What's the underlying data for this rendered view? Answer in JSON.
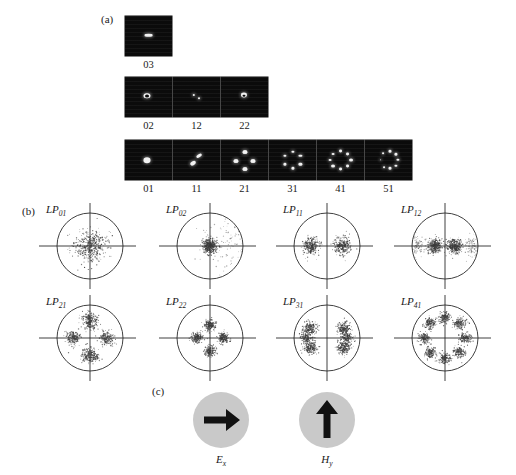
{
  "figure": {
    "background": "#ffffff",
    "ink": "#1a1a1a"
  },
  "panels": {
    "a": {
      "tag": "(a)"
    },
    "b": {
      "tag": "(b)"
    },
    "c": {
      "tag": "(c)"
    }
  },
  "chart_data": {
    "type": "scatter",
    "title": "",
    "xlabel": "",
    "ylabel": "",
    "grid": false,
    "legend": null,
    "near_field_rows": [
      {
        "row": 1,
        "cells": [
          {
            "label": "03",
            "lobes": 1,
            "arrangement": "single-horizontal-bar",
            "points": [
              {
                "x": 50,
                "y": 48,
                "rx": 9.5,
                "ry": 3.0
              }
            ]
          }
        ]
      },
      {
        "row": 2,
        "cells": [
          {
            "label": "02",
            "lobes": 1,
            "arrangement": "ring-bright-core",
            "points": [
              {
                "x": 46,
                "y": 47,
                "rx": 7.5,
                "ry": 7.0
              },
              {
                "x": 46,
                "y": 47,
                "rx": 4.2,
                "ry": 4.0,
                "dark": true
              }
            ]
          },
          {
            "label": "12",
            "lobes": 2,
            "arrangement": "two-faint-lobes",
            "points": [
              {
                "x": 44,
                "y": 44,
                "rx": 2.6,
                "ry": 2.4
              },
              {
                "x": 56,
                "y": 53,
                "rx": 2.2,
                "ry": 2.0
              }
            ]
          },
          {
            "label": "22",
            "lobes": 1,
            "arrangement": "ring-bright-core",
            "points": [
              {
                "x": 48,
                "y": 46,
                "rx": 6.5,
                "ry": 6.2
              },
              {
                "x": 49,
                "y": 47,
                "rx": 3.2,
                "ry": 3.0,
                "dark": true
              }
            ]
          }
        ]
      },
      {
        "row": 3,
        "cells": [
          {
            "label": "01",
            "lobes": 1,
            "arrangement": "single-round-blob",
            "points": [
              {
                "x": 47,
                "y": 50,
                "rx": 7.5,
                "ry": 7.0
              }
            ]
          },
          {
            "label": "11",
            "lobes": 2,
            "arrangement": "two-lobes-diagonal",
            "points": [
              {
                "x": 55,
                "y": 40,
                "rx": 6.0,
                "ry": 4.2,
                "rot": -30
              },
              {
                "x": 42,
                "y": 57,
                "rx": 6.5,
                "ry": 4.6,
                "rot": -30
              }
            ]
          },
          {
            "label": "21",
            "lobes": 4,
            "arrangement": "four-lobe-ring",
            "points": [
              {
                "x": 50,
                "y": 30,
                "rx": 5.4,
                "ry": 4.8
              },
              {
                "x": 69,
                "y": 52,
                "rx": 5.4,
                "ry": 4.8
              },
              {
                "x": 50,
                "y": 72,
                "rx": 5.4,
                "ry": 4.8
              },
              {
                "x": 31,
                "y": 52,
                "rx": 5.4,
                "ry": 4.8
              }
            ]
          },
          {
            "label": "31",
            "lobes": 6,
            "arrangement": "six-lobe-ring",
            "points": [
              {
                "x": 50,
                "y": 30,
                "rx": 3.4,
                "ry": 3.0
              },
              {
                "x": 67,
                "y": 40,
                "rx": 3.4,
                "ry": 3.0
              },
              {
                "x": 67,
                "y": 61,
                "rx": 3.4,
                "ry": 3.0
              },
              {
                "x": 50,
                "y": 71,
                "rx": 3.4,
                "ry": 3.0
              },
              {
                "x": 33,
                "y": 61,
                "rx": 3.4,
                "ry": 3.0
              },
              {
                "x": 33,
                "y": 40,
                "rx": 3.4,
                "ry": 3.0
              }
            ]
          },
          {
            "label": "41",
            "lobes": 8,
            "arrangement": "eight-lobe-ring",
            "points": [
              {
                "x": 50,
                "y": 28,
                "rx": 4.2,
                "ry": 3.8
              },
              {
                "x": 65,
                "y": 34,
                "rx": 4.2,
                "ry": 3.8
              },
              {
                "x": 72,
                "y": 50,
                "rx": 4.2,
                "ry": 3.8
              },
              {
                "x": 65,
                "y": 66,
                "rx": 4.2,
                "ry": 3.8
              },
              {
                "x": 50,
                "y": 72,
                "rx": 4.2,
                "ry": 3.8
              },
              {
                "x": 35,
                "y": 66,
                "rx": 4.2,
                "ry": 3.8
              },
              {
                "x": 28,
                "y": 50,
                "rx": 3.0,
                "ry": 2.8
              },
              {
                "x": 35,
                "y": 34,
                "rx": 3.0,
                "ry": 2.8
              }
            ]
          },
          {
            "label": "51",
            "lobes": 8,
            "arrangement": "eight-lobe-ring-partial",
            "points": [
              {
                "x": 54,
                "y": 28,
                "rx": 3.2,
                "ry": 2.9
              },
              {
                "x": 66,
                "y": 36,
                "rx": 3.4,
                "ry": 3.0
              },
              {
                "x": 70,
                "y": 50,
                "rx": 3.4,
                "ry": 3.0
              },
              {
                "x": 66,
                "y": 64,
                "rx": 3.4,
                "ry": 3.0
              },
              {
                "x": 54,
                "y": 71,
                "rx": 3.2,
                "ry": 2.9
              },
              {
                "x": 40,
                "y": 68,
                "rx": 2.0,
                "ry": 1.8
              },
              {
                "x": 33,
                "y": 50,
                "rx": 2.0,
                "ry": 1.8
              },
              {
                "x": 38,
                "y": 33,
                "rx": 2.0,
                "ry": 1.8
              }
            ]
          }
        ]
      }
    ],
    "far_field_plots": [
      {
        "label": "LP",
        "sub": "01",
        "lobe_count": 1,
        "lobes": [
          {
            "r": 0.0,
            "theta": 0,
            "spread": 0.46,
            "n": 420,
            "weight": 1.0
          }
        ]
      },
      {
        "label": "LP",
        "sub": "02",
        "lobe_count": 1,
        "lobes": [
          {
            "r": 0.0,
            "theta": 0,
            "spread": 0.22,
            "n": 380,
            "weight": 1.0
          },
          {
            "r": 0.72,
            "theta": 0,
            "spread": 0.95,
            "n": 150,
            "weight": 0.25
          }
        ]
      },
      {
        "label": "LP",
        "sub": "11",
        "lobe_count": 2,
        "lobes": [
          {
            "r": 0.46,
            "theta": 0,
            "spread": 0.26,
            "n": 260,
            "weight": 1.0
          },
          {
            "r": 0.46,
            "theta": 180,
            "spread": 0.26,
            "n": 260,
            "weight": 1.0
          }
        ]
      },
      {
        "label": "LP",
        "sub": "12",
        "lobe_count": 2,
        "lobes": [
          {
            "r": 0.3,
            "theta": 0,
            "spread": 0.22,
            "n": 300,
            "weight": 1.0
          },
          {
            "r": 0.3,
            "theta": 180,
            "spread": 0.22,
            "n": 300,
            "weight": 1.0
          },
          {
            "r": 0.84,
            "theta": 0,
            "spread": 0.3,
            "n": 110,
            "weight": 0.3
          },
          {
            "r": 0.84,
            "theta": 180,
            "spread": 0.3,
            "n": 110,
            "weight": 0.3
          }
        ]
      },
      {
        "label": "LP",
        "sub": "21",
        "lobe_count": 4,
        "lobes": [
          {
            "r": 0.52,
            "theta": 90,
            "spread": 0.24,
            "n": 230,
            "weight": 1.0
          },
          {
            "r": 0.52,
            "theta": 0,
            "spread": 0.22,
            "n": 200,
            "weight": 0.85
          },
          {
            "r": 0.52,
            "theta": 270,
            "spread": 0.24,
            "n": 230,
            "weight": 1.0
          },
          {
            "r": 0.52,
            "theta": 180,
            "spread": 0.22,
            "n": 200,
            "weight": 0.85
          }
        ]
      },
      {
        "label": "LP",
        "sub": "22",
        "lobe_count": 4,
        "lobes": [
          {
            "r": 0.4,
            "theta": 90,
            "spread": 0.17,
            "n": 170,
            "weight": 1.0
          },
          {
            "r": 0.4,
            "theta": 0,
            "spread": 0.17,
            "n": 170,
            "weight": 1.0
          },
          {
            "r": 0.4,
            "theta": 270,
            "spread": 0.17,
            "n": 170,
            "weight": 1.0
          },
          {
            "r": 0.4,
            "theta": 180,
            "spread": 0.17,
            "n": 170,
            "weight": 1.0
          }
        ]
      },
      {
        "label": "LP",
        "sub": "31",
        "lobe_count": 6,
        "lobes": [
          {
            "r": 0.58,
            "theta": 30,
            "spread": 0.2,
            "n": 175,
            "weight": 1.0
          },
          {
            "r": 0.58,
            "theta": 150,
            "spread": 0.2,
            "n": 175,
            "weight": 1.0
          },
          {
            "r": 0.58,
            "theta": 210,
            "spread": 0.2,
            "n": 175,
            "weight": 1.0
          },
          {
            "r": 0.58,
            "theta": 330,
            "spread": 0.2,
            "n": 175,
            "weight": 1.0
          },
          {
            "r": 0.62,
            "theta": 0,
            "spread": 0.18,
            "n": 150,
            "weight": 0.9
          },
          {
            "r": 0.62,
            "theta": 180,
            "spread": 0.18,
            "n": 150,
            "weight": 0.9
          }
        ]
      },
      {
        "label": "LP",
        "sub": "41",
        "lobe_count": 8,
        "lobes": [
          {
            "r": 0.62,
            "theta": 90,
            "spread": 0.17,
            "n": 140,
            "weight": 1.0
          },
          {
            "r": 0.62,
            "theta": 45,
            "spread": 0.17,
            "n": 140,
            "weight": 1.0
          },
          {
            "r": 0.62,
            "theta": 0,
            "spread": 0.17,
            "n": 140,
            "weight": 1.0
          },
          {
            "r": 0.62,
            "theta": 315,
            "spread": 0.17,
            "n": 140,
            "weight": 1.0
          },
          {
            "r": 0.62,
            "theta": 270,
            "spread": 0.17,
            "n": 140,
            "weight": 1.0
          },
          {
            "r": 0.62,
            "theta": 225,
            "spread": 0.17,
            "n": 140,
            "weight": 1.0
          },
          {
            "r": 0.62,
            "theta": 180,
            "spread": 0.17,
            "n": 140,
            "weight": 1.0
          },
          {
            "r": 0.62,
            "theta": 135,
            "spread": 0.17,
            "n": 140,
            "weight": 1.0
          }
        ]
      }
    ],
    "field_orientations": [
      {
        "symbol": "E",
        "sub": "x",
        "direction": "right",
        "disk_color": "#c9c9c9",
        "arrow_color": "#111111"
      },
      {
        "symbol": "H",
        "sub": "y",
        "direction": "up",
        "disk_color": "#c9c9c9",
        "arrow_color": "#111111"
      }
    ]
  }
}
